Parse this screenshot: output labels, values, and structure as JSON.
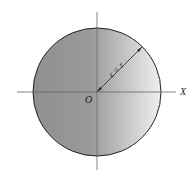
{
  "diagram": {
    "type": "circle-with-axes",
    "labels": {
      "origin": "O",
      "x_axis": "X",
      "radius": "ε = r"
    },
    "colors": {
      "fill_dark": "#8e8e8e",
      "fill_light": "#f2f2f2",
      "outline": "#222222",
      "axis": "#666666"
    }
  }
}
